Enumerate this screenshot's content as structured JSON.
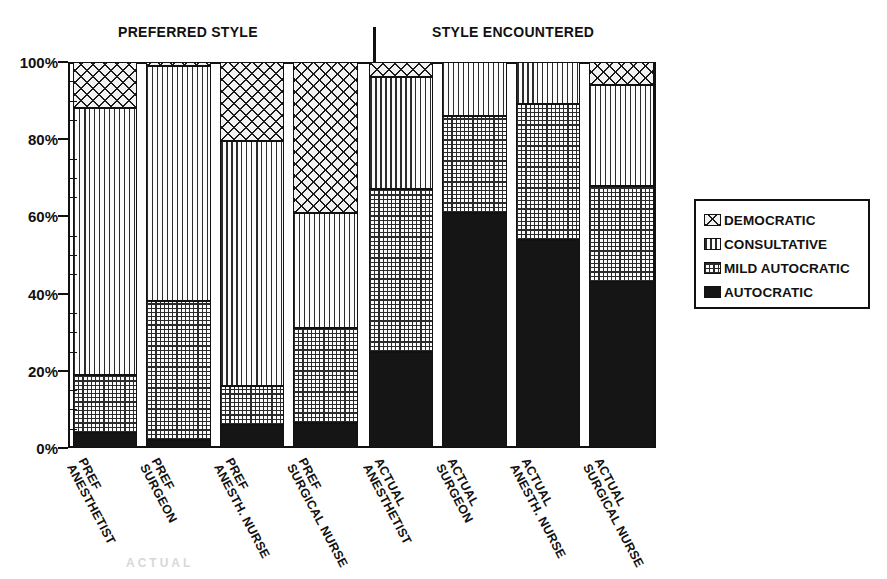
{
  "groups": {
    "preferred": "PREFERRED STYLE",
    "encountered": "STYLE ENCOUNTERED"
  },
  "legend": {
    "items": [
      {
        "label": "DEMOCRATIC",
        "pattern": "cross-hatch"
      },
      {
        "label": "CONSULTATIVE",
        "pattern": "vertical-lines"
      },
      {
        "label": "MILD AUTOCRATIC",
        "pattern": "grid"
      },
      {
        "label": "AUTOCRATIC",
        "pattern": "solid-black"
      }
    ]
  },
  "chart_data": {
    "type": "bar",
    "title": "",
    "subtitle": "",
    "xlabel": "",
    "ylabel": "",
    "ylim": [
      0,
      100
    ],
    "ytick_labels": [
      "0%",
      "20%",
      "40%",
      "60%",
      "80%",
      "100%"
    ],
    "ytick_values": [
      0,
      20,
      40,
      60,
      80,
      100
    ],
    "minor_tick_step": 5,
    "grid": false,
    "stacked": true,
    "stack_total": 100,
    "legend_position": "right",
    "group_headers": [
      "PREFERRED STYLE",
      "STYLE ENCOUNTERED"
    ],
    "group_split_after_category": 4,
    "categories": [
      "ANESTHETIST PREF",
      "SURGEON PREF",
      "ANESTH. NURSE PREF",
      "SURGICAL NURSE PREF",
      "ANESTHETIST ACTUAL",
      "SURGEON ACTUAL",
      "ANESTH. NURSE ACTUAL",
      "SURGICAL NURSE ACTUAL"
    ],
    "category_lines": [
      [
        "ANESTHETIST",
        "PREF"
      ],
      [
        "SURGEON",
        "PREF"
      ],
      [
        "ANESTH. NURSE",
        "PREF"
      ],
      [
        "SURGICAL NURSE",
        "PREF"
      ],
      [
        "ANESTHETIST",
        "ACTUAL"
      ],
      [
        "SURGEON",
        "ACTUAL"
      ],
      [
        "ANESTH. NURSE",
        "ACTUAL"
      ],
      [
        "SURGICAL NURSE",
        "ACTUAL"
      ]
    ],
    "series": [
      {
        "name": "AUTOCRATIC",
        "values": [
          4,
          2,
          6,
          6.5,
          25,
          61,
          54,
          43
        ]
      },
      {
        "name": "MILD AUTOCRATIC",
        "values": [
          15,
          36,
          10,
          24.5,
          42,
          25,
          35,
          25
        ]
      },
      {
        "name": "CONSULTATIVE",
        "values": [
          69,
          61,
          63.5,
          30,
          29,
          14,
          11,
          26
        ]
      },
      {
        "name": "DEMOCRATIC",
        "values": [
          12,
          1,
          20.5,
          39,
          4,
          0,
          0,
          6
        ]
      }
    ],
    "cumulative_tops": [
      [
        4,
        19,
        88,
        100
      ],
      [
        2,
        38,
        99,
        100
      ],
      [
        6,
        16,
        79.5,
        100
      ],
      [
        6.5,
        31,
        61,
        100
      ],
      [
        25,
        67,
        96,
        100
      ],
      [
        61,
        86,
        100,
        100
      ],
      [
        54,
        89,
        100,
        100
      ],
      [
        43,
        68,
        94,
        100
      ]
    ]
  },
  "scan_artifact": "ACTUAL"
}
